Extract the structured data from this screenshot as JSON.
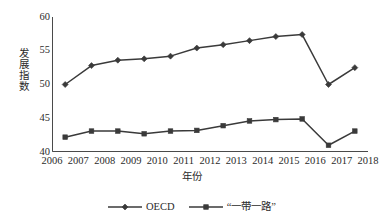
{
  "chart_data": {
    "type": "line",
    "title": "",
    "subtitle": "",
    "xlabel": "年份",
    "ylabel": "发展指数",
    "x": [
      2006,
      2007,
      2008,
      2009,
      2010,
      2011,
      2012,
      2013,
      2014,
      2015,
      2016,
      2017
    ],
    "xtick_labels": [
      "2006",
      "2007",
      "2008",
      "2009",
      "2010",
      "2011",
      "2012",
      "2013",
      "2014",
      "2015",
      "2016",
      "2017",
      "2018"
    ],
    "xlim": [
      2006,
      2018
    ],
    "ytick_labels": [
      "40",
      "45",
      "50",
      "55",
      "60"
    ],
    "ytick_values": [
      40,
      45,
      50,
      55,
      60
    ],
    "ylim": [
      40,
      60
    ],
    "grid": false,
    "legend_position": "bottom",
    "series": [
      {
        "name": "OECD",
        "marker": "diamond",
        "color": "#3a3a3a",
        "values": [
          50.0,
          52.8,
          53.6,
          53.8,
          54.2,
          55.4,
          55.9,
          56.5,
          57.1,
          57.4,
          50.0,
          52.5
        ]
      },
      {
        "name": "“一带一路”",
        "marker": "square",
        "color": "#3a3a3a",
        "values": [
          42.2,
          43.1,
          43.1,
          42.7,
          43.1,
          43.2,
          43.9,
          44.6,
          44.8,
          44.9,
          41.0,
          43.1
        ]
      }
    ]
  },
  "axes": {
    "y_title": "发展指数",
    "x_title": "年份"
  },
  "legend": {
    "entries": [
      {
        "label": "OECD"
      },
      {
        "label": "“一带一路”"
      }
    ]
  },
  "colors": {
    "line": "#3a3a3a",
    "axis": "#4a4a4a",
    "text": "#2b2b2b",
    "background": "#ffffff"
  }
}
